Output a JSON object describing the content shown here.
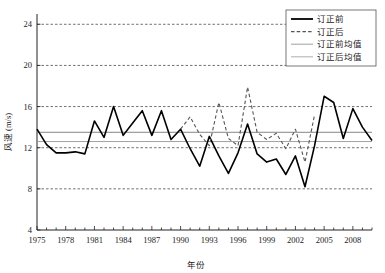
{
  "chart_data": {
    "type": "line",
    "title": "",
    "xlabel": "年份",
    "ylabel": "风速 (m/s)",
    "xlim": [
      1975,
      2010
    ],
    "ylim": [
      4,
      25
    ],
    "yticks": [
      4,
      8,
      12,
      16,
      20,
      24
    ],
    "ytick_labels": [
      "4",
      "8",
      "12",
      "16",
      "20",
      "24"
    ],
    "xticks": [
      1975,
      1978,
      1981,
      1984,
      1987,
      1990,
      1993,
      1996,
      1999,
      2002,
      2005,
      2008
    ],
    "xtick_labels": [
      "1975",
      "1978",
      "1981",
      "1984",
      "1987",
      "1990",
      "1993",
      "1996",
      "1999",
      "2002",
      "2005",
      "2008"
    ],
    "xtick_minor_step": 1,
    "grid": true,
    "grid_style": "dashed",
    "legend_position": "top-right",
    "series": [
      {
        "name": "订正前",
        "style": "solid",
        "color": "#000000",
        "width": 1.6,
        "x": [
          1975,
          1976,
          1977,
          1978,
          1979,
          1980,
          1981,
          1982,
          1983,
          1984,
          1985,
          1986,
          1987,
          1988,
          1989,
          1990,
          1991,
          1992,
          1993,
          1994,
          1995,
          1996,
          1997,
          1998,
          1999,
          2000,
          2001,
          2002,
          2003,
          2004,
          2005,
          2006,
          2007,
          2008,
          2009,
          2010
        ],
        "values": [
          13.8,
          12.3,
          11.5,
          11.5,
          11.6,
          11.4,
          14.6,
          13.0,
          16.0,
          13.2,
          14.4,
          15.6,
          13.2,
          15.6,
          12.8,
          13.8,
          11.9,
          10.2,
          13.1,
          11.2,
          9.5,
          11.5,
          14.3,
          11.4,
          10.6,
          10.9,
          9.4,
          11.2,
          8.2,
          12.2,
          17.0,
          16.4,
          12.9,
          15.8,
          14.0,
          12.7
        ]
      },
      {
        "name": "订正后",
        "style": "dashed",
        "color": "#555555",
        "width": 1.1,
        "x": [
          1990,
          1991,
          1992,
          1993,
          1994,
          1995,
          1996,
          1997,
          1998,
          1999,
          2000,
          2001,
          2002,
          2003,
          2004
        ],
        "values": [
          13.8,
          15.0,
          13.3,
          12.2,
          16.4,
          12.9,
          12.2,
          17.9,
          13.5,
          12.8,
          13.4,
          11.9,
          13.8,
          10.6,
          15.2
        ]
      }
    ],
    "mean_lines": [
      {
        "name": "订正前均值",
        "value": 13.5,
        "color": "#777777",
        "width": 0.9
      },
      {
        "name": "订正后均值",
        "value": 12.6,
        "color": "#999999",
        "width": 0.9
      }
    ],
    "legend_entries": [
      {
        "label": "订正前",
        "style": "solid",
        "color": "#000000",
        "width": 1.8
      },
      {
        "label": "订正后",
        "style": "dashed",
        "color": "#555555",
        "width": 1.1
      },
      {
        "label": "订正前均值",
        "style": "solid",
        "color": "#888888",
        "width": 0.8
      },
      {
        "label": "订正后均值",
        "style": "solid",
        "color": "#999999",
        "width": 0.8
      }
    ]
  }
}
